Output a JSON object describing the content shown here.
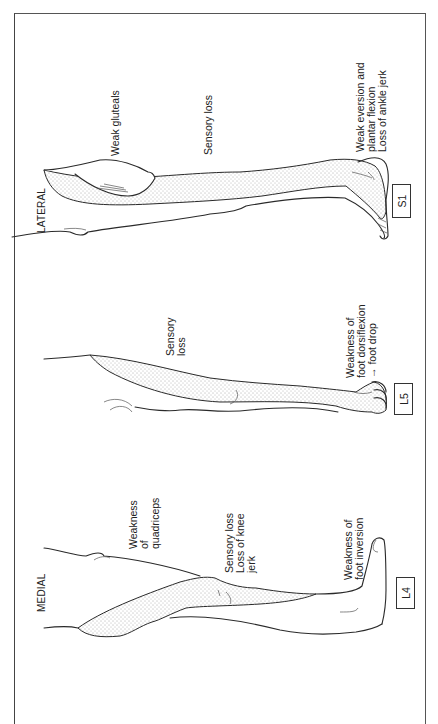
{
  "figure": {
    "orientation": "rotated-90-counterclockwise",
    "frame_color": "#444444",
    "ink_color": "#2a2a2a",
    "views": [
      {
        "id": "lateral",
        "view_label": "LATERAL",
        "root": "S1",
        "annotations": [
          "Weak gluteals",
          "Sensory loss",
          "Weak eversion and\nplantar flexion\nLoss of ankle jerk"
        ]
      },
      {
        "id": "l5",
        "view_label": "",
        "root": "L5",
        "annotations": [
          "Sensory\nloss",
          "Weakness of\nfoot dorsiflexion\n→ foot drop"
        ]
      },
      {
        "id": "medial",
        "view_label": "MEDIAL",
        "root": "L4",
        "annotations": [
          "Weakness\nof\nquadriceps",
          "Sensory loss\nLoss of knee\njerk",
          "Weakness of\nfoot inversion"
        ]
      }
    ]
  }
}
